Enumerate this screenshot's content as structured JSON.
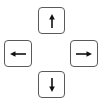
{
  "keys": {
    "up": {
      "label": "↑",
      "icon": "arrow-up-icon"
    },
    "left": {
      "label": "←",
      "icon": "arrow-left-icon"
    },
    "right": {
      "label": "→",
      "icon": "arrow-right-icon"
    },
    "down": {
      "label": "↓",
      "icon": "arrow-down-icon"
    }
  },
  "colors": {
    "background": "#ffffff",
    "key_border": "#5a5a5a",
    "arrow": "#111111"
  }
}
